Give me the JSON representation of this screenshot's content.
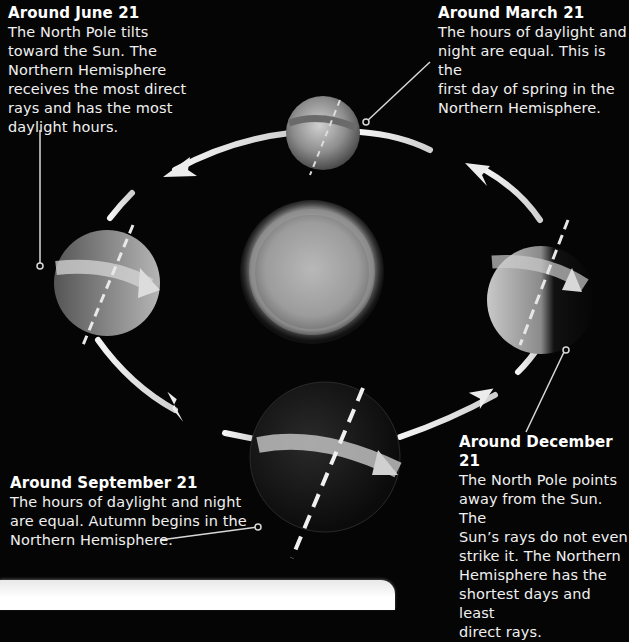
{
  "diagram": {
    "center": {
      "label": "Sun",
      "icon": "sun"
    },
    "positions": [
      {
        "id": "june",
        "title": "Around June 21",
        "description": "The North Pole tilts toward the Sun. The Northern Hemisphere receives the most direct rays and has the most daylight hours.",
        "lines": [
          "The North Pole tilts",
          "toward the Sun. The",
          "Northern Hemisphere",
          "receives the most direct",
          "rays and has the most",
          "daylight hours."
        ]
      },
      {
        "id": "march",
        "title": "Around March 21",
        "description": "The hours of daylight and night are equal. This is the first day of spring in the Northern Hemisphere.",
        "lines": [
          "The hours of daylight and",
          "night are equal. This is the",
          "first day of spring in the",
          "Northern Hemisphere."
        ]
      },
      {
        "id": "september",
        "title": "Around September 21",
        "description": "The hours of daylight and night are equal. Autumn begins in the Northern Hemisphere.",
        "lines": [
          "The hours of daylight and night",
          "are equal. Autumn begins in the",
          "Northern Hemisphere."
        ]
      },
      {
        "id": "december",
        "title": "Around December 21",
        "description": "The North Pole points away from the Sun. The Sun's rays do not even strike it. The Northern Hemisphere has the shortest days and least direct rays.",
        "lines": [
          "The North Pole points",
          "away from the Sun. The",
          "Sun’s rays do not even",
          "strike it. The Northern",
          "Hemisphere has the",
          "shortest days and least",
          "direct rays."
        ]
      }
    ],
    "colors": {
      "background": "#050505",
      "text": "#f0f0f0",
      "orbit": "#e6e6e6",
      "sun": "#9a9a9a"
    }
  }
}
